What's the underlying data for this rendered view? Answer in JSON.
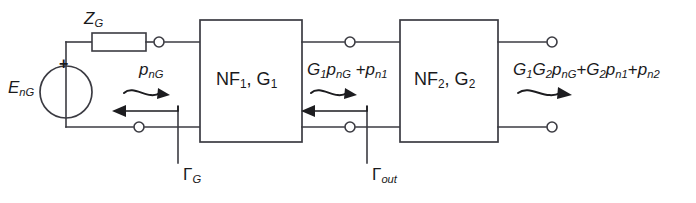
{
  "figure": {
    "type": "circuit-block-diagram",
    "background_color": "#ffffff",
    "line_color": "#3b3b42",
    "text_color": "#1a1a1c"
  },
  "source": {
    "symbol_name": "voltage-source",
    "label": "E",
    "label_sub": "nG",
    "polarity": "+"
  },
  "impedance": {
    "symbol_name": "resistor",
    "label": "Z",
    "label_sub": "G"
  },
  "blocks": [
    {
      "id": "stage-1",
      "label_main": "NF",
      "label_sub1": "1",
      "label_mid": ", G",
      "label_sub2": "1",
      "text": "NF1, G1"
    },
    {
      "id": "stage-2",
      "label_main": "NF",
      "label_sub1": "2",
      "label_mid": ", G",
      "label_sub2": "2",
      "text": "NF2, G2"
    }
  ],
  "power_labels": {
    "input": {
      "text": "pnG",
      "p": "p",
      "sub": "nG"
    },
    "interstage": {
      "text": "G1 pnG + pn1",
      "parts": [
        {
          "sym": "G",
          "sub": "1"
        },
        {
          "sym": "p",
          "sub": "nG"
        },
        {
          "op": " +"
        },
        {
          "sym": "p",
          "sub": "n1"
        }
      ]
    },
    "output": {
      "text": "G1G2 pnG + G2 pn1 + pn2",
      "parts": [
        {
          "sym": "G",
          "sub": "1"
        },
        {
          "sym": "G",
          "sub": "2"
        },
        {
          "sym": "p",
          "sub": "nG"
        },
        {
          "op": "+"
        },
        {
          "sym": "G",
          "sub": "2"
        },
        {
          "sym": "p",
          "sub": "n1"
        },
        {
          "op": "+"
        },
        {
          "sym": "p",
          "sub": "n2"
        }
      ]
    }
  },
  "reflection_coefficients": [
    {
      "id": "gamma-source",
      "symbol": "Γ",
      "sub": "G",
      "text": "ΓG"
    },
    {
      "id": "gamma-output",
      "symbol": "Γ",
      "sub": "out",
      "text": "Γout"
    }
  ],
  "arrows": {
    "forward": "wavy-arrow-right",
    "reverse": "straight-arrow-left"
  },
  "terminals": {
    "symbol_name": "open-circle-terminal",
    "count": 6
  }
}
